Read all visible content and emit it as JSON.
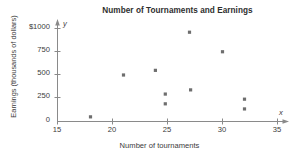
{
  "chart_data": {
    "type": "scatter",
    "title": "Number of Tournaments and Earnings",
    "xlabel": "Number of tournaments",
    "ylabel": "Earnings (thousands of dollars)",
    "x_axis_variable": "x",
    "y_axis_variable": "y",
    "xlim": [
      15,
      35
    ],
    "ylim": [
      0,
      1050
    ],
    "grid": false,
    "legend": null,
    "xticks": [
      15,
      20,
      25,
      30,
      35
    ],
    "xtick_labels": [
      "15",
      "20",
      "25",
      "30",
      "35"
    ],
    "yticks": [
      0,
      250,
      500,
      750,
      1000
    ],
    "ytick_labels": [
      "0",
      "250",
      "500",
      "750",
      "$1000"
    ],
    "series": [
      {
        "name": "Golfers",
        "marker": "square",
        "color": "#6e6e6e",
        "points": [
          {
            "x": 18.0,
            "y": 50
          },
          {
            "x": 21.0,
            "y": 500
          },
          {
            "x": 23.9,
            "y": 550
          },
          {
            "x": 24.8,
            "y": 295
          },
          {
            "x": 24.8,
            "y": 190
          },
          {
            "x": 27.0,
            "y": 960
          },
          {
            "x": 27.1,
            "y": 340
          },
          {
            "x": 30.0,
            "y": 750
          },
          {
            "x": 32.0,
            "y": 240
          },
          {
            "x": 32.0,
            "y": 135
          }
        ]
      }
    ]
  }
}
